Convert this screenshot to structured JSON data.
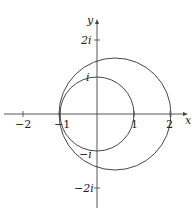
{
  "diagram": {
    "axes": {
      "x_label": "x",
      "y_label": "y",
      "x_ticks": [
        "−2",
        "−1",
        "1",
        "2"
      ],
      "y_ticks": [
        "2i",
        "i",
        "−i",
        "−2i"
      ]
    },
    "curves": [
      {
        "name": "unit-circle",
        "center": [
          0,
          0
        ],
        "radius": 1
      },
      {
        "name": "large-circle",
        "center": [
          0.5,
          0
        ],
        "radius": 1.5
      }
    ],
    "colors": {
      "stroke": "#333333",
      "background": "#ffffff"
    }
  }
}
